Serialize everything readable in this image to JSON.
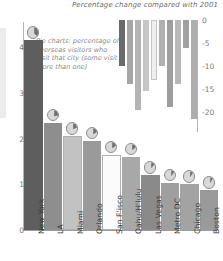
{
  "chart_data": {
    "type": "bar",
    "title": "Percentage change compared with 2001",
    "annotation": "Pie charts: percentage of overseas visitors who visit that city (some visit more than one)",
    "xlabel": "",
    "ylabel": "",
    "categories": [
      "New York",
      "LA",
      "Miami",
      "Orlando",
      "San F'isco",
      "Oahu/H'lulu",
      "Las Vegas",
      "Metro DC",
      "Chicago",
      "Boston"
    ],
    "series": [
      {
        "name": "Overseas visitors (millions)",
        "axis": "left",
        "values": [
          4.15,
          2.35,
          2.05,
          1.95,
          1.65,
          1.6,
          1.2,
          1.03,
          1.0,
          0.87
        ],
        "colors": [
          "#5e5e5e",
          "#8e8e8e",
          "#c2c2c2",
          "#9a9a9a",
          "#fbfbfb",
          "#a8a8a8",
          "#8a8a8a",
          "#9f9f9f",
          "#a3a3a3",
          "#9a9a9a"
        ]
      },
      {
        "name": "Percentage change compared with 2001",
        "axis": "right",
        "values": [
          -10.0,
          -14.0,
          -19.5,
          -15.5,
          -13.0,
          -10.0,
          -19.0,
          -14.0,
          -6.0,
          -21.5
        ],
        "colors": [
          "#6a6a6a",
          "#a6a6a6",
          "#b4b4b4",
          "#c6c6c6",
          "#efefef",
          "#b0b0b0",
          "#9e9e9e",
          "#b8b8b8",
          "#a0a0a0",
          "#aeaeae"
        ]
      },
      {
        "name": "Share of overseas visitors who visit that city (%)",
        "type": "pie",
        "values": [
          38,
          22,
          18,
          17,
          15,
          14,
          11,
          10,
          9,
          8
        ]
      }
    ],
    "left_axis": {
      "ticks": [
        "0",
        "1",
        "2",
        "3",
        "4"
      ],
      "tick_values": [
        0,
        1,
        2,
        3,
        4
      ],
      "ylim": [
        0,
        4.55
      ]
    },
    "right_axis": {
      "ticks": [
        "0",
        "-5",
        "-10",
        "-15",
        "-20"
      ],
      "tick_values": [
        0,
        -5,
        -10,
        -15,
        -20
      ],
      "ylim": [
        -24,
        0
      ]
    },
    "grid": false,
    "legend": "none"
  }
}
